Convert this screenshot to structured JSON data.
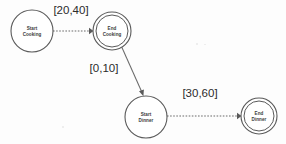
{
  "diagram": {
    "type": "state-transition-diagram",
    "background_color": "#fdfdfd",
    "stroke_color": "#5a5a5a",
    "text_color": "#2b2b2b",
    "nodes": [
      {
        "id": "start-cooking",
        "label_line1": "Start",
        "label_line2": "Cooking",
        "shape": "circle",
        "accepting": false,
        "cx": 32,
        "cy": 31,
        "r": 21
      },
      {
        "id": "end-cooking",
        "label_line1": "End",
        "label_line2": "Cooking",
        "shape": "double-circle",
        "accepting": true,
        "cx": 112,
        "cy": 31,
        "r": 19,
        "r_inner": 16
      },
      {
        "id": "start-dinner",
        "label_line1": "Start",
        "label_line2": "Dinner",
        "shape": "circle",
        "accepting": false,
        "cx": 146,
        "cy": 117,
        "r": 21
      },
      {
        "id": "end-dinner",
        "label_line1": "End",
        "label_line2": "Dinner",
        "shape": "double-circle",
        "accepting": true,
        "cx": 259,
        "cy": 116,
        "r": 18,
        "r_inner": 15
      }
    ],
    "edges": [
      {
        "id": "edge-start-cooking-to-end-cooking",
        "from": "start-cooking",
        "to": "end-cooking",
        "label": "[20,40]",
        "style": "dashed",
        "x1": 53,
        "y1": 31,
        "x2": 92,
        "y2": 31,
        "label_x": 71,
        "label_y": 14
      },
      {
        "id": "edge-end-cooking-to-start-dinner",
        "from": "end-cooking",
        "to": "start-dinner",
        "label": "[0,10]",
        "style": "solid",
        "x1": 122,
        "y1": 47,
        "x2": 143,
        "y2": 95,
        "label_x": 104,
        "label_y": 72
      },
      {
        "id": "edge-start-dinner-to-end-dinner",
        "from": "start-dinner",
        "to": "end-dinner",
        "label": "[30,60]",
        "style": "dashed",
        "x1": 167,
        "y1": 116,
        "x2": 240,
        "y2": 116,
        "label_x": 200,
        "label_y": 97
      }
    ]
  }
}
